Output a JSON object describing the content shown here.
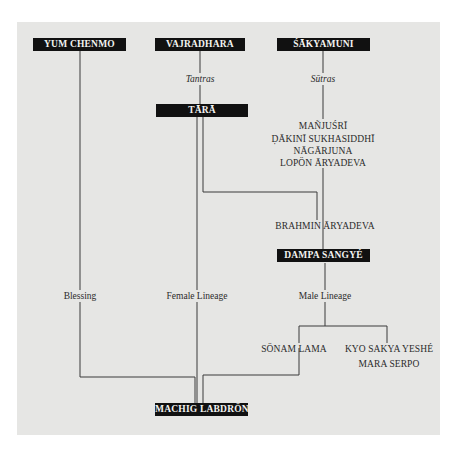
{
  "diagram": {
    "type": "lineage-tree",
    "root_nodes": [
      {
        "id": "yum_chenmo",
        "label": "YUM CHENMO"
      },
      {
        "id": "vajradhara",
        "label": "VAJRADHARA"
      },
      {
        "id": "sakyamuni",
        "label": "ŚĀKYAMUNI"
      }
    ],
    "boxed_nodes": {
      "yum_chenmo": "YUM CHENMO",
      "vajradhara": "VAJRADHARA",
      "sakyamuni": "ŚĀKYAMUNI",
      "tara": "TĀRĀ",
      "dampa_sangye": "DAMPA SANGYÉ",
      "machig_labdron": "MACHIG LABDRÖN"
    },
    "plain_nodes": {
      "manjusri": "MAÑJUŚRĪ",
      "dakini": "ḌĀKINĪ SUKHASIDDHĪ",
      "nagarjuna": "NĀGĀRJUNA",
      "lopon_aryadeva": "LOPÖN ĀRYADEVA",
      "brahmin_aryadeva": "BRAHMIN ĀRYADEVA",
      "sonam_lama": "SÖNAM LAMA",
      "kyo_sakya_yeshe": "KYO SAKYA YESHÉ",
      "mara_serpo": "MARA SERPO"
    },
    "edge_labels": {
      "tantras": "Tantras",
      "sutras": "Sūtras",
      "blessing": "Blessing",
      "female_lineage": "Female Lineage",
      "male_lineage": "Male Lineage"
    },
    "edges": [
      {
        "from": "vajradhara",
        "to": "tara",
        "label": "Tantras"
      },
      {
        "from": "sakyamuni",
        "to": "manjusri",
        "label": "Sūtras"
      },
      {
        "from": "manjusri",
        "to": "dakini"
      },
      {
        "from": "dakini",
        "to": "nagarjuna"
      },
      {
        "from": "nagarjuna",
        "to": "lopon_aryadeva"
      },
      {
        "from": "lopon_aryadeva",
        "to": "dampa_sangye"
      },
      {
        "from": "tara",
        "to": "brahmin_aryadeva"
      },
      {
        "from": "brahmin_aryadeva",
        "to": "dampa_sangye"
      },
      {
        "from": "yum_chenmo",
        "to": "machig_labdron",
        "label": "Blessing"
      },
      {
        "from": "tara",
        "to": "machig_labdron",
        "label": "Female Lineage"
      },
      {
        "from": "dampa_sangye",
        "to": "sonam_lama",
        "label": "Male Lineage"
      },
      {
        "from": "dampa_sangye",
        "to": "kyo_sakya_yeshe",
        "label": "Male Lineage"
      },
      {
        "from": "kyo_sakya_yeshe",
        "to": "mara_serpo"
      },
      {
        "from": "sonam_lama",
        "to": "machig_labdron"
      }
    ],
    "colors": {
      "panel_bg": "#e6e6e4",
      "box_bg": "#111111",
      "box_text": "#f4f4f2",
      "line": "#3a3a3a",
      "text": "#2b2b2b"
    }
  }
}
